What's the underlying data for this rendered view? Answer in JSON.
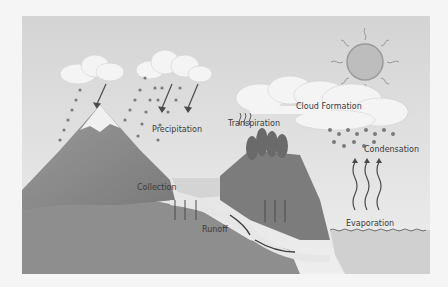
{
  "diagram": {
    "labels": {
      "precipitation": "Precipitation",
      "transpiration": "Transpiration",
      "cloud_formation": "Cloud Formation",
      "condensation": "Condensation",
      "collection": "Collection",
      "runoff": "Runoff",
      "evaporation": "Evaporation"
    },
    "colors": {
      "sky": "#dcdcdc",
      "cloud": "#f4f4f4",
      "sun": "#b8b8b8",
      "mountain": "#8a8a8a",
      "snow": "#f0f0f0",
      "ground": "#909090",
      "water": "#cfcfcf",
      "trees": "#6e6e6e",
      "arrow": "#4a4a4a"
    }
  }
}
